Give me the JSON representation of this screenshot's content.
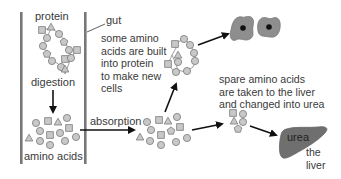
{
  "diagram": {
    "labels": {
      "protein": "protein",
      "gut": "gut",
      "digestion": "digestion",
      "amino_acids": "amino acids",
      "absorption": "absorption",
      "new_cells_note": "some amino\nacids are built\ninto protein\nto make new\ncells",
      "liver_note": "spare amino acids\nare taken to the liver\nand changed into urea",
      "urea": "urea",
      "liver": "the\nliver"
    },
    "colors": {
      "gut_wall": "#777777",
      "shape_fill": "#c8c8c8",
      "shape_stroke": "#7a7a7a",
      "cell_fill": "#8e8e8e",
      "nucleus": "#111111",
      "liver_fill": "#6f6f6f",
      "arrow": "#111111"
    }
  }
}
